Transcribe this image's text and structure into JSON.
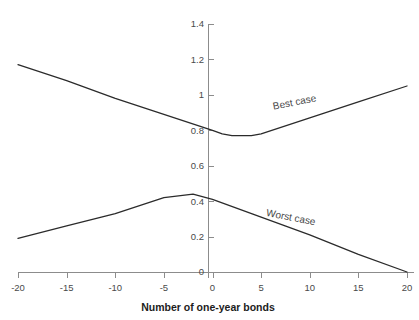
{
  "chart_data": {
    "type": "line",
    "title": "",
    "xlabel": "Number of one-year bonds",
    "ylabel": "",
    "xlim": [
      -20,
      20
    ],
    "ylim": [
      0,
      1.4
    ],
    "grid": false,
    "legend": "inline-labels",
    "xticks": [
      -20,
      -15,
      -10,
      -5,
      0,
      5,
      10,
      15,
      20
    ],
    "xtick_labels": [
      "-20",
      "-15",
      "-10",
      "-5",
      "0",
      "5",
      "10",
      "15",
      "20"
    ],
    "yticks": [
      0,
      0.2,
      0.4,
      0.6,
      0.8,
      1,
      1.2,
      1.4
    ],
    "ytick_labels": [
      "0",
      "0.2",
      "0.4",
      "0.6",
      "0.8",
      "1",
      "1.2",
      "1.4"
    ],
    "series": [
      {
        "name": "Best case",
        "label": "Best case",
        "color": "#2b2b2b",
        "x": [
          -20,
          -15,
          -10,
          -5,
          0,
          1,
          2,
          3,
          4,
          5,
          10,
          15,
          20
        ],
        "values": [
          1.17,
          1.08,
          0.98,
          0.89,
          0.8,
          0.78,
          0.77,
          0.77,
          0.77,
          0.78,
          0.87,
          0.96,
          1.05
        ]
      },
      {
        "name": "Worst case",
        "label": "Worst case",
        "color": "#2b2b2b",
        "x": [
          -20,
          -15,
          -10,
          -5,
          -2,
          0,
          5,
          10,
          15,
          20
        ],
        "values": [
          0.19,
          0.26,
          0.33,
          0.42,
          0.44,
          0.41,
          0.31,
          0.21,
          0.1,
          0.0
        ]
      }
    ],
    "annotations": [
      {
        "text": "Best case",
        "x": 8.5,
        "y": 0.94,
        "rotation": -11
      },
      {
        "text": "Worst case",
        "x": 8.0,
        "y": 0.29,
        "rotation": 11
      }
    ]
  }
}
